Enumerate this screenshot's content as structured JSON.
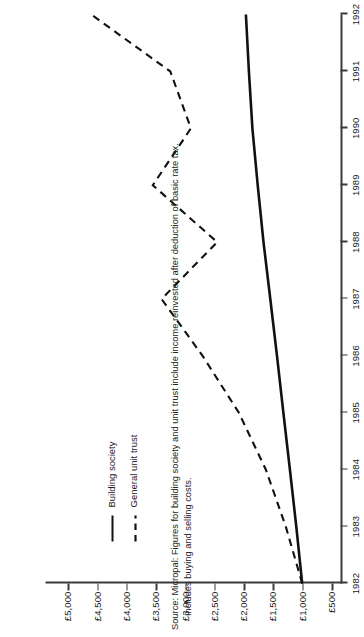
{
  "chart_data": {
    "type": "line",
    "title": "",
    "xlabel": "",
    "ylabel": "",
    "orientation": "rotated-90-ccw",
    "x": [
      1982,
      1983,
      1984,
      1985,
      1986,
      1987,
      1988,
      1989,
      1990,
      1991,
      1992
    ],
    "xtick_labels": [
      "1982",
      "1983",
      "1984",
      "1985",
      "1986",
      "1987",
      "1988",
      "1989",
      "1990",
      "1991",
      "1992"
    ],
    "xlim": [
      1982,
      1992
    ],
    "ytick_labels": [
      "£5,000",
      "£4,500",
      "£4,000",
      "£3,500",
      "£3,000",
      "£2,500",
      "£2,000",
      "£1,500",
      "£1,000",
      "£500"
    ],
    "ytick_values": [
      5000,
      4500,
      4000,
      3500,
      3000,
      2500,
      2000,
      1500,
      1000,
      500
    ],
    "ylim": [
      500,
      5000
    ],
    "grid": false,
    "legend_position": "upper-left",
    "series": [
      {
        "name": "Building society",
        "style": "solid",
        "color": "#111111",
        "values": [
          1000,
          1100,
          1210,
          1320,
          1430,
          1545,
          1660,
          1760,
          1850,
          1910,
          1960
        ]
      },
      {
        "name": "General unit trust",
        "style": "dashed",
        "color": "#111111",
        "values": [
          1000,
          1280,
          1620,
          2080,
          2700,
          3400,
          2450,
          3550,
          2900,
          3250,
          4600
        ]
      }
    ]
  },
  "legend": {
    "items": [
      {
        "label": "Building society",
        "style": "solid"
      },
      {
        "label": "General unit trust",
        "style": "dashed"
      }
    ]
  },
  "footnote": {
    "line1": "Source: Micropal: Figures for building society and unit trust include income reinvested after deduction of basic rate tax.",
    "line2": "Includes buying and selling costs."
  }
}
